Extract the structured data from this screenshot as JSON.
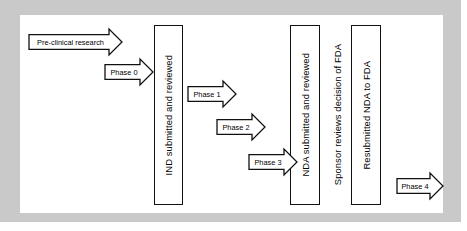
{
  "slide": {
    "frame_color": "#c9c9c9",
    "canvas_color": "#ffffff",
    "outline_color": "#111111"
  },
  "diagram": {
    "type": "flowchart",
    "arrows": [
      {
        "id": "pre-clinical-research",
        "label": "Pre-clinical research",
        "x": 8,
        "y": 13,
        "w": 95,
        "h": 28
      },
      {
        "id": "phase-0",
        "label": "Phase 0",
        "x": 84,
        "y": 43,
        "w": 50,
        "h": 28
      },
      {
        "id": "phase-1",
        "label": "Phase 1",
        "x": 167,
        "y": 65,
        "w": 50,
        "h": 28
      },
      {
        "id": "phase-2",
        "label": "Phase 2",
        "x": 196,
        "y": 98,
        "w": 50,
        "h": 28
      },
      {
        "id": "phase-3",
        "label": "Phase 3",
        "x": 228,
        "y": 133,
        "w": 50,
        "h": 28
      },
      {
        "id": "phase-4",
        "label": "Phase 4",
        "x": 376,
        "y": 157,
        "w": 48,
        "h": 28
      }
    ],
    "boxes": [
      {
        "id": "ind-submitted-and-reviewed",
        "label": "IND submitted and reviewed",
        "x": 134,
        "y": 10,
        "w": 29,
        "h": 180,
        "boxed": true
      },
      {
        "id": "nda-submitted-and-reviewed",
        "label": "NDA submitted and reviewed",
        "x": 270,
        "y": 10,
        "w": 30,
        "h": 180,
        "boxed": true
      },
      {
        "id": "sponsor-reviews-decision-of-fda",
        "label": "Sponsor reviews decision of FDA",
        "x": 306,
        "y": 10,
        "w": 22,
        "h": 180,
        "boxed": false
      },
      {
        "id": "resubmitted-nda-to-fda",
        "label": "Resubmitted NDA to FDA",
        "x": 331,
        "y": 10,
        "w": 30,
        "h": 180,
        "boxed": true
      }
    ]
  }
}
